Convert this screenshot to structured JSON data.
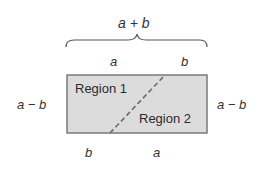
{
  "diagram": {
    "top_label": "a + b",
    "top_segments": [
      "a",
      "b"
    ],
    "bottom_segments": [
      "b",
      "a"
    ],
    "left_label": "a − b",
    "right_label": "a − b",
    "regions": [
      "Region 1",
      "Region 2"
    ],
    "colors": {
      "fill": "#dcdcdc",
      "border": "#7a7a7a",
      "dash": "#6a6a6a",
      "text": "#333333"
    }
  }
}
